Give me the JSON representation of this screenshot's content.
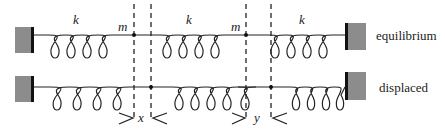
{
  "diagram": {
    "rows": [
      {
        "id": "equilibrium",
        "label": "equilibrium",
        "spring_labels": [
          "k",
          "k",
          "k"
        ],
        "mass_labels": [
          "m",
          "m"
        ]
      },
      {
        "id": "displaced",
        "label": "displaced",
        "displacement_labels": [
          "x",
          "y"
        ]
      }
    ],
    "colors": {
      "wall_fill": "#8c8c8c",
      "wall_edge": "#111111",
      "line": "#222222"
    }
  }
}
